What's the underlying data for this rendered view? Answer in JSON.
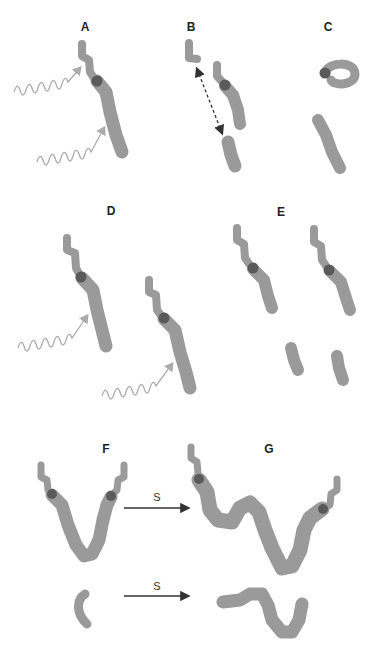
{
  "figure": {
    "panels": [
      {
        "id": "A",
        "label": "A",
        "x": 85,
        "y": 20
      },
      {
        "id": "B",
        "label": "B",
        "x": 191,
        "y": 20
      },
      {
        "id": "C",
        "label": "C",
        "x": 328,
        "y": 20
      },
      {
        "id": "D",
        "label": "D",
        "x": 111,
        "y": 204
      },
      {
        "id": "E",
        "label": "E",
        "x": 281,
        "y": 205
      },
      {
        "id": "F",
        "label": "F",
        "x": 106,
        "y": 442
      },
      {
        "id": "G",
        "label": "G",
        "x": 269,
        "y": 442
      }
    ],
    "arrow_labels": [
      {
        "text": "S",
        "x": 157,
        "y": 491
      },
      {
        "text": "S",
        "x": 157,
        "y": 580
      }
    ],
    "colors": {
      "chromosome": "#9a9a9a",
      "centromere": "#5a5a5a",
      "wavy_arrow": "#ababab",
      "dashed_arrow": "#333333",
      "straight_arrow": "#333333"
    }
  }
}
